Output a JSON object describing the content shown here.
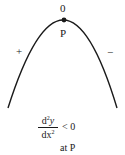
{
  "diagram": {
    "type": "concave-down-parabola",
    "stroke_color": "#1a1a1a",
    "apex_label_top": "0",
    "apex_label_bottom": "P",
    "left_sign": "+",
    "right_sign": "−",
    "condition": {
      "numerator_base": "d",
      "numerator_exp": "2",
      "numerator_var": "y",
      "denominator_base": "dx",
      "denominator_exp": "2",
      "relation": "< 0",
      "qualifier": "at P"
    }
  }
}
